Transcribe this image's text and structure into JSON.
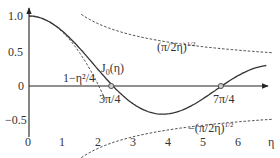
{
  "chart_data": {
    "type": "line",
    "title": "",
    "xlabel": "η",
    "ylabel": "",
    "xlim": [
      0,
      7
    ],
    "ylim": [
      -0.7,
      1.1
    ],
    "grid": false,
    "x_ticks": [
      "0",
      "1",
      "2",
      "3",
      "4",
      "5",
      "6"
    ],
    "y_ticks": [
      "1.0",
      "0.5",
      "0",
      "−0.5"
    ],
    "series": [
      {
        "name": "J0(η)",
        "style": "solid",
        "function": "Bessel J0",
        "x": [
          0,
          0.5,
          1,
          1.5,
          2,
          2.356,
          2.5,
          3,
          3.5,
          3.832,
          4,
          4.5,
          5,
          5.5,
          5.498,
          6,
          6.5,
          6.8
        ],
        "values": [
          1.0,
          0.938,
          0.765,
          0.512,
          0.224,
          0.0,
          -0.048,
          -0.26,
          -0.38,
          -0.403,
          -0.397,
          -0.321,
          -0.178,
          -0.007,
          0.0,
          0.151,
          0.26,
          0.293
        ]
      },
      {
        "name": "1−η²/4",
        "style": "dashed",
        "x": [
          0,
          0.5,
          1,
          1.5,
          2,
          2.2
        ],
        "values": [
          1.0,
          0.9375,
          0.75,
          0.4375,
          0.0,
          -0.21
        ]
      },
      {
        "name": "(π/2η)^1/2",
        "style": "dashed",
        "x": [
          1.5,
          2,
          3,
          4,
          5,
          6,
          7
        ],
        "values": [
          1.023,
          0.886,
          0.724,
          0.627,
          0.561,
          0.512,
          0.474
        ]
      },
      {
        "name": "−(π/2η)^1/2",
        "style": "dashed",
        "x": [
          1.5,
          2,
          3,
          4,
          5,
          6,
          7
        ],
        "values": [
          -1.023,
          -0.886,
          -0.724,
          -0.627,
          -0.561,
          -0.512,
          -0.474
        ]
      }
    ],
    "annotations": [
      {
        "text": "J0(η)",
        "x": 2.2,
        "y": 0.28
      },
      {
        "text": "1−η²/4",
        "x": 0.1,
        "y": 0.1
      },
      {
        "text": "(π/2η)^1/2",
        "x": 5.0,
        "y": 0.6
      },
      {
        "text": "−(π/2η)^1/2",
        "x": 5.0,
        "y": -0.75
      },
      {
        "text": "3π/4",
        "x": 2.356,
        "y": -0.12,
        "marker": "circle at zero"
      },
      {
        "text": "7π/4",
        "x": 5.498,
        "y": -0.12,
        "marker": "circle at zero"
      }
    ]
  },
  "labels": {
    "j0": "J",
    "j0_sub": "0",
    "j0_arg": "(η)",
    "taylor": "1−η²/4",
    "env_pos": "(π/2η)",
    "env_neg": "−(π/2η)",
    "exp": "1/2",
    "zero1": "3π/4",
    "zero2": "7π/4",
    "xaxis": "η"
  },
  "ticks": {
    "x": [
      "0",
      "1",
      "2",
      "3",
      "4",
      "5",
      "6"
    ],
    "y": [
      "1.0",
      "0.5",
      "0",
      "−0.5"
    ]
  }
}
